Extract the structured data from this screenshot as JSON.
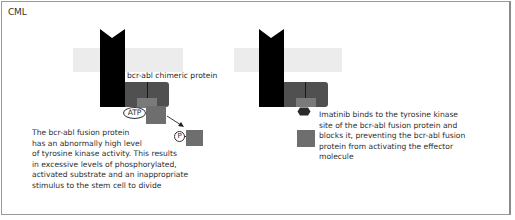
{
  "title": "CML",
  "left_panel": {
    "protein_label": "bcr-abl chimeric protein",
    "atp_label": "ATP",
    "phosphate_label": "P",
    "caption_lines": [
      "The bcr-abl fusion protein",
      "has an abnormally high level",
      "of tyrosine kinase activity. This results",
      "in excessive levels of phosphorylated,",
      "activated substrate and an inappropriate",
      "stimulus to the stem cell to divide"
    ]
  },
  "right_panel": {
    "caption_lines": [
      "Imatinib binds to the tyrosine kinase",
      "site of the bcr-abl fusion protein and",
      "blocks it, preventing the bcr-abl fusion",
      "protein from activating the effector",
      "molecule"
    ]
  },
  "colors": {
    "receptor": "#000000",
    "membrane_band": "#ececec",
    "kinase_domain": "#505050",
    "atp_site": "#7a7a7a",
    "substrate": "#6e6e6e",
    "imatinib": "#2a2a2a",
    "frame_border": "#9a9a9a"
  },
  "icons": {
    "receptor": "receptor-shape-icon",
    "imatinib": "hexagon-icon",
    "arrow": "arrow-icon"
  }
}
